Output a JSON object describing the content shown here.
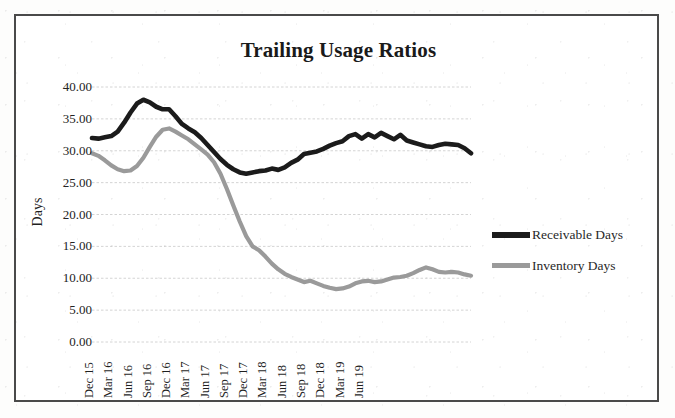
{
  "chart_data": {
    "type": "line",
    "title": "Trailing Usage Ratios",
    "xlabel": "",
    "ylabel": "Days",
    "ylim": [
      0,
      40
    ],
    "ytick_step": 5,
    "ytick_labels": [
      "0.00",
      "5.00",
      "10.00",
      "15.00",
      "20.00",
      "25.00",
      "30.00",
      "35.00",
      "40.00"
    ],
    "grid": true,
    "legend_position": "right",
    "x_tick_labels": [
      "Dec 15",
      "Mar 16",
      "Jun 16",
      "Sep 16",
      "Dec 16",
      "Mar 17",
      "Jun 17",
      "Sep 17",
      "Dec 17",
      "Mar 18",
      "Jun 18",
      "Sep 18",
      "Dec 18",
      "Mar 19",
      "Jun 19"
    ],
    "x": [
      "Dec 15",
      "Jan 16",
      "Feb 16",
      "Mar 16",
      "Apr 16",
      "May 16",
      "Jun 16",
      "Jul 16",
      "Aug 16",
      "Sep 16",
      "Oct 16",
      "Nov 16",
      "Dec 16",
      "Jan 17",
      "Feb 17",
      "Mar 17",
      "Apr 17",
      "May 17",
      "Jun 17",
      "Jul 17",
      "Aug 17",
      "Sep 17",
      "Oct 17",
      "Nov 17",
      "Dec 17",
      "Jan 18",
      "Feb 18",
      "Mar 18",
      "Apr 18",
      "May 18",
      "Jun 18",
      "Jul 18",
      "Aug 18",
      "Sep 18",
      "Oct 18",
      "Nov 18",
      "Dec 18",
      "Jan 19",
      "Feb 19",
      "Mar 19",
      "Apr 19",
      "May 19",
      "Jun 19"
    ],
    "series": [
      {
        "name": "Receivable Days",
        "color": "#1b1b1b",
        "values": [
          32.0,
          31.9,
          32.1,
          32.3,
          33.0,
          34.4,
          36.0,
          37.4,
          38.0,
          37.6,
          36.9,
          36.5,
          36.5,
          35.4,
          34.2,
          33.5,
          32.9,
          32.0,
          30.9,
          29.8,
          28.7,
          27.8,
          27.1,
          26.6,
          26.4,
          26.6,
          26.8,
          26.9,
          27.2,
          27.0,
          27.4,
          28.1,
          28.6,
          29.5,
          29.7,
          29.9,
          30.3,
          30.8,
          31.2,
          31.5,
          32.3,
          32.6,
          31.9
        ]
      },
      {
        "name": "Inventory Days",
        "color": "#9a9a9a",
        "values": [
          29.6,
          29.2,
          28.5,
          27.7,
          27.1,
          26.8,
          26.9,
          27.6,
          28.9,
          30.6,
          32.2,
          33.3,
          33.5,
          33.0,
          32.4,
          31.8,
          31.0,
          30.2,
          29.4,
          28.2,
          26.4,
          24.0,
          21.4,
          18.9,
          16.6,
          15.0,
          14.4,
          13.4,
          12.3,
          11.4,
          10.7,
          10.2,
          9.8,
          9.4,
          9.6,
          9.2,
          8.8,
          8.5,
          8.3,
          8.4,
          8.7,
          9.2,
          9.5
        ]
      }
    ],
    "series_tail": {
      "note": "extended monthly values continue to Jun 19",
      "receivable": [
        32.6,
        32.1,
        32.8,
        32.3,
        31.8,
        32.5,
        31.6,
        31.3,
        31.0,
        30.7,
        30.6,
        30.9,
        31.1,
        31.0,
        30.9,
        30.4,
        29.6
      ],
      "inventory": [
        9.6,
        9.4,
        9.5,
        9.8,
        10.1,
        10.2,
        10.4,
        10.8,
        11.3,
        11.7,
        11.4,
        11.0,
        10.9,
        11.0,
        10.9,
        10.6,
        10.4
      ]
    },
    "annotations": []
  },
  "legend": {
    "items": [
      {
        "label": "Receivable Days",
        "color": "#1b1b1b"
      },
      {
        "label": "Inventory Days",
        "color": "#9a9a9a"
      }
    ]
  }
}
